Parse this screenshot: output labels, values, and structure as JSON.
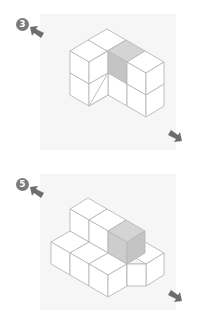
{
  "figures": [
    {
      "label": "3",
      "shaded_color": "#d4d4d4",
      "shaded_side_color": "#c4c4c4",
      "edge_color": "#b8b8b8",
      "arrow_color": "#6e6e6e",
      "badge_color": "#7a7a7a"
    },
    {
      "label": "5",
      "shaded_color": "#d4d4d4",
      "shaded_side_color": "#c4c4c4",
      "edge_color": "#b8b8b8",
      "arrow_color": "#6e6e6e",
      "badge_color": "#7a7a7a"
    }
  ]
}
